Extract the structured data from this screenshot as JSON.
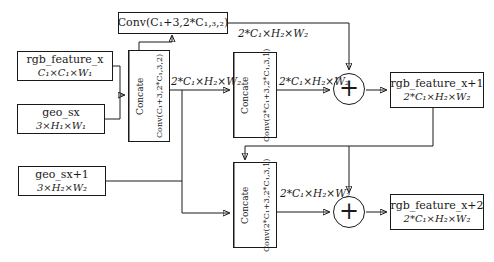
{
  "diagram": {
    "type": "residual-fusion-block-flow",
    "colors": {
      "line": "#1a1a1a",
      "background": "#ffffff",
      "box_fill": "#ffffff"
    },
    "plus_symbol": "+",
    "conv_top": {
      "label": "Conv(C₁+3,2*C₁,₃,₂)"
    },
    "inputs": {
      "rgb_feature_x": {
        "title": "rgb_feature_x",
        "dims": "C₁×C₁×W₁"
      },
      "geo_sx": {
        "title": "geo_sx",
        "dims": "3×H₁×W₁"
      },
      "geo_sx1": {
        "title": "geo_sx+1",
        "dims": "3×H₂×W₂"
      }
    },
    "outputs": {
      "rgb_feature_x1": {
        "title": "rgb_feature_x+1",
        "dims": "2*C₁×H₂×W₂"
      },
      "rgb_feature_x2": {
        "title": "rgb_feature_x+2",
        "dims": "2*C₁×H₂×W₂"
      }
    },
    "blocks": {
      "block1": {
        "concate": "Concate",
        "conv": "Conv(C₁+3,2*C₁,3,2)"
      },
      "block2": {
        "concate": "Concate",
        "conv": "Conv(2*C₁+3,2*C₁,3,1)"
      },
      "block3": {
        "concate": "Concate",
        "conv": "Conv(2*C₁+3,2*C₁,3,1)"
      }
    },
    "edge_labels": {
      "shortcut_top": "2*C₁×H₂×W₂",
      "conv1_out": "2*C₁×H₂×W₂",
      "conv2_out": "2*C₁×H₂×W₂",
      "conv3_out": "2*C₁×H₂×W₂"
    }
  }
}
